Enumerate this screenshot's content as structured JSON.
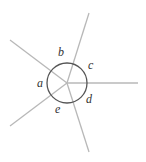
{
  "diagram": {
    "type": "angles-around-a-point",
    "center": {
      "x": 67,
      "y": 83
    },
    "circle_radius": 20,
    "colors": {
      "rays": "#b8b8b8",
      "circle": "#555555",
      "labels": "#333333"
    },
    "rays": [
      {
        "name": "ray-up-right",
        "x2": 89,
        "y2": 13
      },
      {
        "name": "ray-right",
        "x2": 138,
        "y2": 83
      },
      {
        "name": "ray-down",
        "x2": 89,
        "y2": 152
      },
      {
        "name": "ray-down-left",
        "x2": 10,
        "y2": 126
      },
      {
        "name": "ray-up-left",
        "x2": 10,
        "y2": 40
      }
    ],
    "labels": [
      {
        "text": "a",
        "x": 37,
        "y": 87
      },
      {
        "text": "b",
        "x": 58,
        "y": 56
      },
      {
        "text": "c",
        "x": 88,
        "y": 69
      },
      {
        "text": "d",
        "x": 86,
        "y": 103
      },
      {
        "text": "e",
        "x": 55,
        "y": 113
      }
    ]
  }
}
